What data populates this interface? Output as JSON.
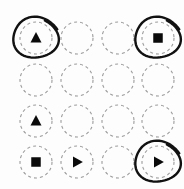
{
  "canvas": {
    "width": 184,
    "height": 189,
    "background_color": "#fdfdfd",
    "title": "Shape grid with hand-drawn circle annotations"
  },
  "style": {
    "circle_stroke_color": "#9a9a9a",
    "circle_dash_pattern": "3 3",
    "glyph_color": "#0a0a0a",
    "lasso_color": "#111111",
    "circle_radius": 16
  },
  "legend": {
    "glyph_names": [
      "triangle-up",
      "square",
      "play-right",
      "empty"
    ],
    "annotation_name": "hand-drawn-lasso"
  },
  "grid": {
    "rows": 4,
    "columns": 4,
    "column_centers": [
      36,
      77,
      118,
      158
    ],
    "row_centers": [
      38,
      80,
      121,
      162
    ],
    "cells": [
      {
        "row": 0,
        "col": 0,
        "cx": 36,
        "cy": 38,
        "shape": "triangle-up",
        "annotated": true
      },
      {
        "row": 0,
        "col": 1,
        "cx": 77,
        "cy": 38,
        "shape": "empty",
        "annotated": false
      },
      {
        "row": 0,
        "col": 2,
        "cx": 118,
        "cy": 38,
        "shape": "empty",
        "annotated": false
      },
      {
        "row": 0,
        "col": 3,
        "cx": 158,
        "cy": 38,
        "shape": "square",
        "annotated": true
      },
      {
        "row": 1,
        "col": 0,
        "cx": 36,
        "cy": 80,
        "shape": "empty",
        "annotated": false
      },
      {
        "row": 1,
        "col": 1,
        "cx": 77,
        "cy": 80,
        "shape": "empty",
        "annotated": false
      },
      {
        "row": 1,
        "col": 2,
        "cx": 118,
        "cy": 80,
        "shape": "empty",
        "annotated": false
      },
      {
        "row": 1,
        "col": 3,
        "cx": 158,
        "cy": 80,
        "shape": "empty",
        "annotated": false
      },
      {
        "row": 2,
        "col": 0,
        "cx": 36,
        "cy": 121,
        "shape": "triangle-up",
        "annotated": false
      },
      {
        "row": 2,
        "col": 1,
        "cx": 77,
        "cy": 121,
        "shape": "empty",
        "annotated": false
      },
      {
        "row": 2,
        "col": 2,
        "cx": 118,
        "cy": 121,
        "shape": "empty",
        "annotated": false
      },
      {
        "row": 2,
        "col": 3,
        "cx": 158,
        "cy": 121,
        "shape": "empty",
        "annotated": false
      },
      {
        "row": 3,
        "col": 0,
        "cx": 36,
        "cy": 162,
        "shape": "square",
        "annotated": false
      },
      {
        "row": 3,
        "col": 1,
        "cx": 77,
        "cy": 162,
        "shape": "play-right",
        "annotated": false
      },
      {
        "row": 3,
        "col": 2,
        "cx": 118,
        "cy": 162,
        "shape": "empty",
        "annotated": false
      },
      {
        "row": 3,
        "col": 3,
        "cx": 158,
        "cy": 162,
        "shape": "play-right",
        "annotated": true
      }
    ]
  },
  "annotations": [
    {
      "name": "lasso-top-left",
      "cx": 36,
      "cy": 38,
      "rx": 22,
      "ry": 20
    },
    {
      "name": "lasso-top-right",
      "cx": 158,
      "cy": 38,
      "rx": 22,
      "ry": 20
    },
    {
      "name": "lasso-bottom-right",
      "cx": 158,
      "cy": 162,
      "rx": 22,
      "ry": 20
    }
  ]
}
